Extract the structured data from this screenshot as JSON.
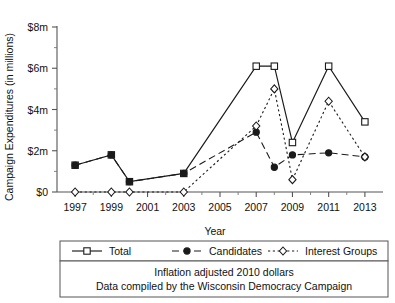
{
  "chart_data": {
    "type": "line",
    "title": "",
    "xlabel": "Year",
    "ylabel": "Campaign Expenditures (in millions)",
    "xlim": [
      1996,
      2014
    ],
    "ylim": [
      0,
      8
    ],
    "grid": false,
    "legend_position": "bottom",
    "x_tick_labels": [
      "1997",
      "1999",
      "2001",
      "2003",
      "2005",
      "2007",
      "2009",
      "2011",
      "2013"
    ],
    "x_ticks": [
      1997,
      1999,
      2001,
      2003,
      2005,
      2007,
      2009,
      2011,
      2013
    ],
    "x_minor_ticks": [
      1998,
      2000,
      2002,
      2004,
      2006,
      2008,
      2010,
      2012
    ],
    "y_tick_labels": [
      "$0",
      "$2m",
      "$4m",
      "$6m",
      "$8m"
    ],
    "y_ticks": [
      0,
      2,
      4,
      6,
      8
    ],
    "y_minor_ticks": [
      1,
      3,
      5,
      7
    ],
    "series": [
      {
        "name": "Total",
        "marker": "open-square",
        "linestyle": "solid",
        "color": "#1a1a1a",
        "x": [
          1997,
          1999,
          2000,
          2003,
          2007,
          2008,
          2009,
          2011,
          2013
        ],
        "values": [
          1.3,
          1.8,
          0.5,
          0.9,
          6.1,
          6.1,
          2.4,
          6.1,
          3.4
        ]
      },
      {
        "name": "Candidates",
        "marker": "filled-circle",
        "linestyle": "dashed",
        "color": "#1a1a1a",
        "x": [
          1997,
          1999,
          2000,
          2003,
          2007,
          2008,
          2009,
          2011,
          2013
        ],
        "values": [
          1.3,
          1.8,
          0.5,
          0.9,
          2.9,
          1.2,
          1.8,
          1.9,
          1.7
        ]
      },
      {
        "name": "Interest Groups",
        "marker": "open-diamond",
        "linestyle": "dotted",
        "color": "#1a1a1a",
        "x": [
          1997,
          1999,
          2000,
          2003,
          2007,
          2008,
          2009,
          2011,
          2013
        ],
        "values": [
          0.0,
          0.0,
          0.0,
          0.0,
          3.2,
          5.0,
          0.6,
          4.4,
          1.7
        ]
      }
    ],
    "annotations": [
      "Inflation adjusted 2010 dollars",
      "Data compiled by the Wisconsin Democracy Campaign"
    ]
  },
  "legend": {
    "entries": [
      {
        "label": "Total"
      },
      {
        "label": "Candidates"
      },
      {
        "label": "Interest Groups"
      }
    ]
  },
  "caption": {
    "line1": "Inflation adjusted 2010 dollars",
    "line2": "Data compiled by the Wisconsin Democracy Campaign"
  }
}
